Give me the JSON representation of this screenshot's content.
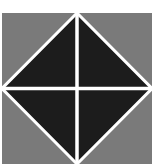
{
  "image": {
    "description": "Square tile with black diamond divided by white cross on gray background",
    "colors": {
      "background": "#ffffff",
      "tile": "#7a7a7a",
      "diamond": "#1c1c1c",
      "lines": "#ffffff"
    }
  }
}
